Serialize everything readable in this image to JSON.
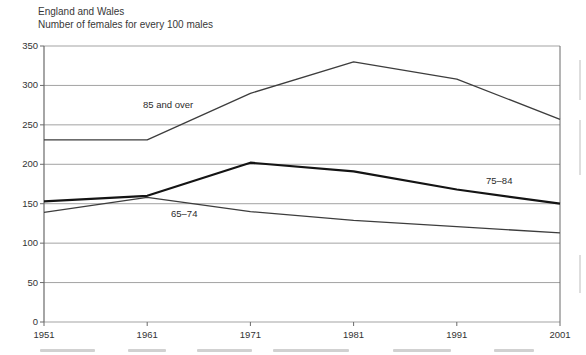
{
  "header": {
    "region": "England and Wales",
    "measure": "Number of females for every 100 males"
  },
  "chart_data": {
    "type": "line",
    "x": [
      1951,
      1961,
      1971,
      1981,
      1991,
      2001
    ],
    "series": [
      {
        "name": "85 and over",
        "values": [
          231,
          231,
          290,
          330,
          308,
          257
        ],
        "emphasis": false
      },
      {
        "name": "75–84",
        "values": [
          153,
          160,
          202,
          191,
          168,
          150
        ],
        "emphasis": true
      },
      {
        "name": "65–74",
        "values": [
          139,
          158,
          140,
          129,
          121,
          113
        ],
        "emphasis": false
      }
    ],
    "title": "England and Wales",
    "subtitle": "Number of females for every 100 males",
    "xlabel": "",
    "ylabel": "",
    "ylim": [
      0,
      350
    ],
    "ytick_step": 50,
    "xticks": [
      1951,
      1961,
      1971,
      1981,
      1991,
      2001
    ],
    "grid": "horizontal",
    "legend": "inline-labels"
  },
  "colors": {
    "background": "#ffffff",
    "grid": "#a3a3a3",
    "axis": "#6a6a6a",
    "line_thin": "#3d3d3d",
    "line_thick": "#141414",
    "text": "#333333"
  }
}
